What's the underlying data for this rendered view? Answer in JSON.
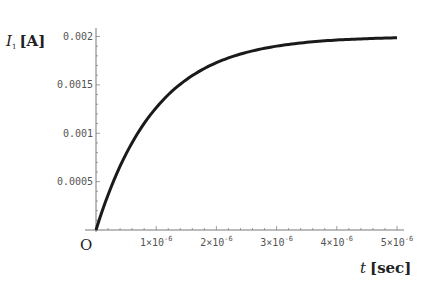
{
  "chart_data": {
    "type": "line",
    "title": "",
    "xlabel": "t [sec]",
    "ylabel": "I1 [A]",
    "xlabel_var": "t",
    "xlabel_unit": "[sec]",
    "ylabel_var": "I",
    "ylabel_sub": "1",
    "ylabel_unit": "[A]",
    "origin_label": "O",
    "xlim": [
      0,
      5e-06
    ],
    "ylim": [
      0,
      0.002
    ],
    "grid": false,
    "legend": null,
    "x_ticks": [
      {
        "value": 1e-06,
        "mant": "1×10",
        "exp": "-6"
      },
      {
        "value": 2e-06,
        "mant": "2×10",
        "exp": "-6"
      },
      {
        "value": 3e-06,
        "mant": "3×10",
        "exp": "-6"
      },
      {
        "value": 4e-06,
        "mant": "4×10",
        "exp": "-6"
      },
      {
        "value": 5e-06,
        "mant": "5×10",
        "exp": "-6"
      }
    ],
    "y_ticks": [
      {
        "value": 0.0005,
        "label": "0.0005"
      },
      {
        "value": 0.001,
        "label": "0.001"
      },
      {
        "value": 0.0015,
        "label": "0.0015"
      },
      {
        "value": 0.002,
        "label": "0.002"
      }
    ],
    "series": [
      {
        "name": "I1(t) = 0.002(1 - e^(-t/1e-6))",
        "x": [
          0,
          2.5e-07,
          5e-07,
          7.5e-07,
          1e-06,
          1.5e-06,
          2e-06,
          2.5e-06,
          3e-06,
          3.5e-06,
          4e-06,
          4.5e-06,
          5e-06
        ],
        "values": [
          0,
          0.000442,
          0.000787,
          0.001055,
          0.001264,
          0.001554,
          0.001729,
          0.001836,
          0.0019,
          0.00194,
          0.001963,
          0.001978,
          0.001987
        ],
        "color": "#1a1a1a"
      }
    ]
  }
}
